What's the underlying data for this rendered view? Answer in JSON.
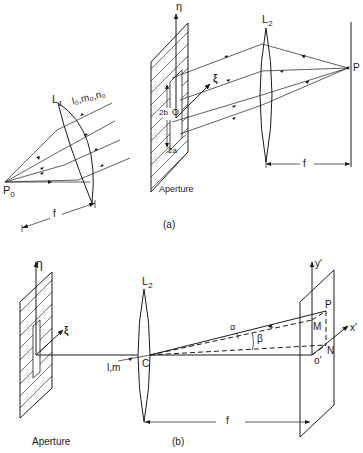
{
  "figure": {
    "part_a": {
      "caption": "(a)",
      "source_point": "P",
      "source_subscript": "0",
      "lens1": {
        "label": "L",
        "subscript": "1"
      },
      "direction_cosines": "l₀,m₀,n₀",
      "focal_length_label_1": "f",
      "aperture_label": "Aperture",
      "eta_axis": "η",
      "xi_axis": "ξ",
      "origin_label": "O",
      "slit_height_label": "2b",
      "slit_width_label": "2a",
      "lens2": {
        "label": "L",
        "subscript": "2"
      },
      "image_point": "P",
      "focal_length_label_2": "f"
    },
    "part_b": {
      "caption": "(b)",
      "aperture_label": "Aperture",
      "eta_axis": "η",
      "xi_axis": "ξ",
      "lens2": {
        "label": "L",
        "subscript": "2"
      },
      "center_label": "C",
      "direction_label": "l,m",
      "alpha_label": "α",
      "beta_label": "β",
      "y_axis": "y′",
      "x_axis": "x′",
      "origin_label": "o′",
      "point_P": "P",
      "point_M": "M",
      "point_N": "N",
      "focal_length_label": "f"
    }
  }
}
